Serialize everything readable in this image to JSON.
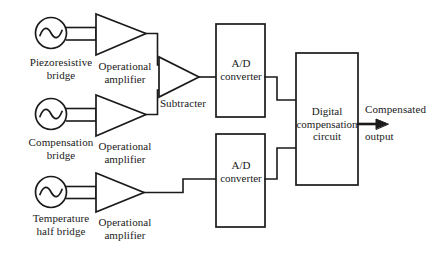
{
  "figure": {
    "type": "block-diagram",
    "background_color": "#ffffff",
    "line_color": "#1a1a1a"
  },
  "blocks": {
    "bridge_1": {
      "label": "Piezoresistive\nbridge",
      "symbol": "ac-source-icon"
    },
    "bridge_2": {
      "label": "Compensation\nbridge",
      "symbol": "ac-source-icon"
    },
    "bridge_3": {
      "label": "Temperature\nhalf bridge",
      "symbol": "ac-source-icon"
    },
    "amp_1": {
      "label": "Operational\namplifier",
      "symbol": "triangle-amplifier-icon"
    },
    "amp_2": {
      "label": "Operational\namplifier",
      "symbol": "triangle-amplifier-icon"
    },
    "amp_3": {
      "label": "Operational\namplifier",
      "symbol": "triangle-amplifier-icon"
    },
    "subtracter": {
      "label": "Subtracter",
      "symbol": "triangle-amplifier-icon"
    },
    "adc_1": {
      "label": "A/D\nconverter",
      "symbol": "rect-block-icon"
    },
    "adc_2": {
      "label": "A/D\nconverter",
      "symbol": "rect-block-icon"
    },
    "digital_compensation": {
      "label": "Digital\ncompensation\ncircuit",
      "symbol": "rect-block-icon"
    }
  },
  "output": {
    "line_1": "Compensated",
    "line_2": "output",
    "arrow": "arrow-right-icon"
  }
}
